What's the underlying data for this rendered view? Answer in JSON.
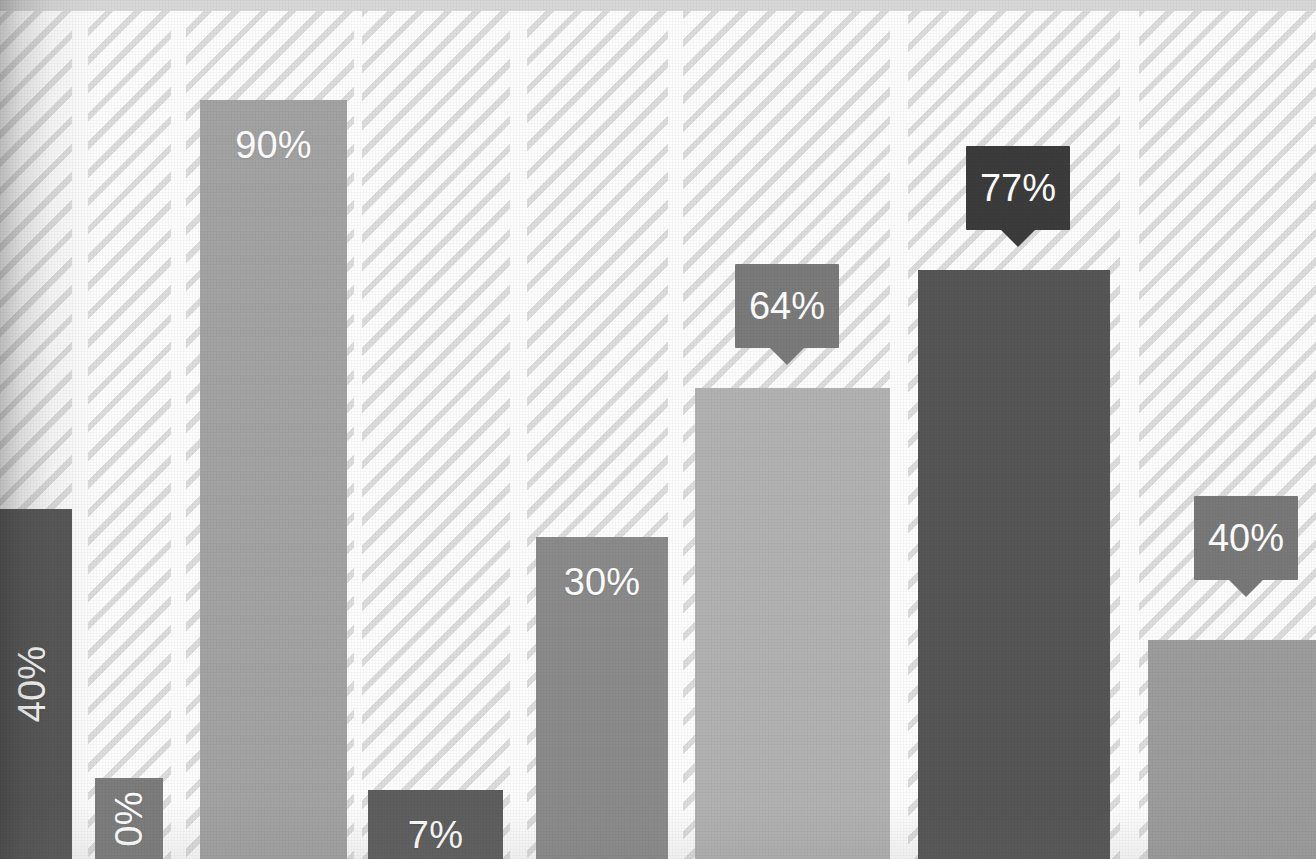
{
  "chart_data": {
    "type": "bar",
    "title": "",
    "subtitle": "",
    "xlabel": "",
    "ylabel": "",
    "ylim": [
      0,
      100
    ],
    "grid": false,
    "legend": null,
    "categories": [
      "",
      "",
      "",
      "",
      "",
      "",
      "",
      ""
    ],
    "values": [
      40,
      0,
      90,
      7,
      30,
      64,
      77,
      40
    ],
    "labels": [
      "40%",
      "0%",
      "90%",
      "7%",
      "30%",
      "64%",
      "77%",
      "40%"
    ],
    "bars": [
      {
        "index": 0,
        "label": "40%",
        "value": 40,
        "color": "#575757",
        "label_style": "in-bar-rotated",
        "clipped_left": true,
        "x": -8,
        "width": 80,
        "top": 509,
        "height": 350
      },
      {
        "index": 1,
        "label": "0%",
        "value": 0,
        "color": "#7d7d7d",
        "label_style": "in-bar-rotated",
        "clipped_left": false,
        "x": 95,
        "width": 68,
        "top": 778,
        "height": 81
      },
      {
        "index": 2,
        "label": "90%",
        "value": 90,
        "color": "#a3a3a3",
        "label_style": "in-bar",
        "clipped_left": false,
        "x": 200,
        "width": 147,
        "top": 100,
        "height": 759
      },
      {
        "index": 3,
        "label": "7%",
        "value": 7,
        "color": "#5e5e5e",
        "label_style": "in-bar",
        "clipped_left": false,
        "x": 368,
        "width": 135,
        "top": 790,
        "height": 69
      },
      {
        "index": 4,
        "label": "30%",
        "value": 30,
        "color": "#8b8b8b",
        "label_style": "in-bar",
        "clipped_left": false,
        "x": 536,
        "width": 132,
        "top": 537,
        "height": 322
      },
      {
        "index": 5,
        "label": "64%",
        "value": 64,
        "color": "#b2b2b2",
        "label_style": "callout",
        "callout_color": "#7b7b7b",
        "clipped_left": false,
        "x": 695,
        "width": 195,
        "top": 388,
        "height": 471,
        "callout_x": 735,
        "callout_y": 264,
        "callout_w": 104,
        "callout_h": 84
      },
      {
        "index": 6,
        "label": "77%",
        "value": 77,
        "color": "#565656",
        "label_style": "callout",
        "callout_color": "#3c3c3c",
        "clipped_left": false,
        "x": 918,
        "width": 192,
        "top": 270,
        "height": 589,
        "callout_x": 966,
        "callout_y": 146,
        "callout_w": 104,
        "callout_h": 84
      },
      {
        "index": 7,
        "label": "40%",
        "value": 40,
        "color": "#9d9d9d",
        "label_style": "callout",
        "callout_color": "#797979",
        "clipped_left": false,
        "x": 1148,
        "width": 168,
        "top": 640,
        "height": 219,
        "callout_x": 1194,
        "callout_y": 496,
        "callout_w": 104,
        "callout_h": 84
      }
    ],
    "tracks": [
      {
        "x": -8,
        "width": 80,
        "top": 11
      },
      {
        "x": 88,
        "width": 83,
        "top": 11
      },
      {
        "x": 186,
        "width": 168,
        "top": 11
      },
      {
        "x": 362,
        "width": 148,
        "top": 11
      },
      {
        "x": 527,
        "width": 141,
        "top": 11
      },
      {
        "x": 683,
        "width": 207,
        "top": 11
      },
      {
        "x": 908,
        "width": 212,
        "top": 11
      },
      {
        "x": 1139,
        "width": 177,
        "top": 11
      }
    ]
  },
  "style": {
    "background": "#fdfdfd",
    "top_band_color": "#d8d8d8",
    "hatch_stripe_color": "#dddddd",
    "hatch_gap_color": "#fdfdfd",
    "label_text_color": "#ffffff"
  }
}
